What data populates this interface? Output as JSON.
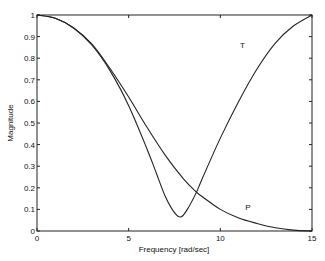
{
  "chart_data": {
    "type": "line",
    "title": "",
    "xlabel": "Frequency [rad/sec]",
    "ylabel": "Magnitude",
    "xlim": [
      0,
      15
    ],
    "ylim": [
      0,
      1
    ],
    "xticks": [
      0,
      5,
      10,
      15
    ],
    "yticks": [
      0,
      0.1,
      0.2,
      0.3,
      0.4,
      0.5,
      0.6,
      0.7,
      0.8,
      0.9,
      1
    ],
    "grid": false,
    "legend": "none",
    "annotations": [
      {
        "text": "T",
        "x": 11.2,
        "y": 0.86
      },
      {
        "text": "P",
        "x": 11.5,
        "y": 0.11
      }
    ],
    "series": [
      {
        "name": "T",
        "x": [
          0,
          1,
          2,
          3,
          4,
          5,
          6,
          6.5,
          7,
          7.5,
          7.85,
          8.2,
          8.7,
          9,
          10,
          11,
          12,
          13,
          14,
          15
        ],
        "y": [
          1,
          0.985,
          0.94,
          0.86,
          0.74,
          0.58,
          0.38,
          0.27,
          0.16,
          0.085,
          0.065,
          0.1,
          0.18,
          0.24,
          0.43,
          0.6,
          0.75,
          0.87,
          0.95,
          1
        ]
      },
      {
        "name": "P",
        "x": [
          0,
          1,
          2,
          3,
          4,
          5,
          6,
          7,
          8,
          8.7,
          9,
          10,
          11,
          12,
          13,
          14,
          15
        ],
        "y": [
          1,
          0.985,
          0.94,
          0.865,
          0.75,
          0.62,
          0.48,
          0.35,
          0.24,
          0.18,
          0.16,
          0.1,
          0.06,
          0.035,
          0.015,
          0.004,
          0
        ]
      }
    ]
  }
}
